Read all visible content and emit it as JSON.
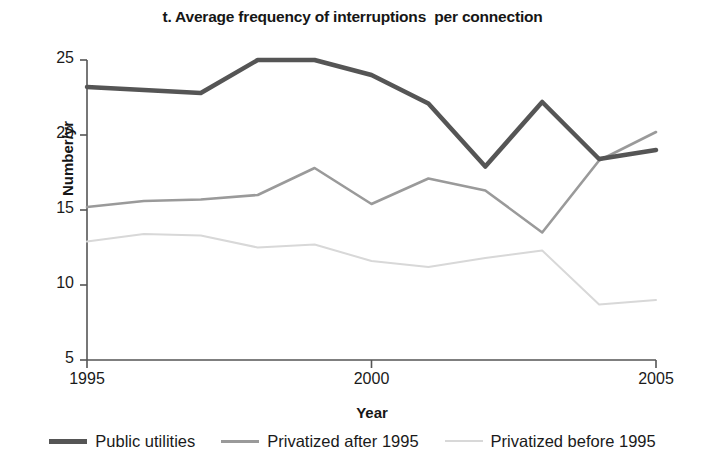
{
  "chart_data": {
    "type": "line",
    "title": "t. Average frequency of interruptions  per connection",
    "xlabel": "Year",
    "ylabel": "Number/yr",
    "x": [
      1995,
      1996,
      1997,
      1998,
      1999,
      2000,
      2001,
      2002,
      2003,
      2004,
      2005
    ],
    "xtick_labels": [
      "1995",
      "2000",
      "2005"
    ],
    "xticks": [
      1995,
      2000,
      2005
    ],
    "ytick_labels": [
      "5",
      "10",
      "15",
      "20",
      "25"
    ],
    "yticks": [
      5,
      10,
      15,
      20,
      25
    ],
    "xlim": [
      1995,
      2005
    ],
    "ylim": [
      5,
      25
    ],
    "grid": false,
    "legend_position": "bottom",
    "series": [
      {
        "name": "Public utilities",
        "color": "#555555",
        "width": 4.5,
        "values": [
          23.2,
          23.0,
          22.8,
          25.0,
          25.0,
          24.0,
          22.1,
          17.9,
          22.2,
          18.4,
          19.0
        ]
      },
      {
        "name": "Privatized after 1995",
        "color": "#9a9a9a",
        "width": 2.6,
        "values": [
          15.2,
          15.6,
          15.7,
          16.0,
          17.8,
          15.4,
          17.1,
          16.3,
          13.5,
          18.3,
          20.2
        ]
      },
      {
        "name": "Privatized before 1995",
        "color": "#d8d8d8",
        "width": 2.0,
        "values": [
          12.9,
          13.4,
          13.3,
          12.5,
          12.7,
          11.6,
          11.2,
          11.8,
          12.3,
          8.7,
          9.0
        ]
      }
    ],
    "axis_color": "#555555"
  }
}
